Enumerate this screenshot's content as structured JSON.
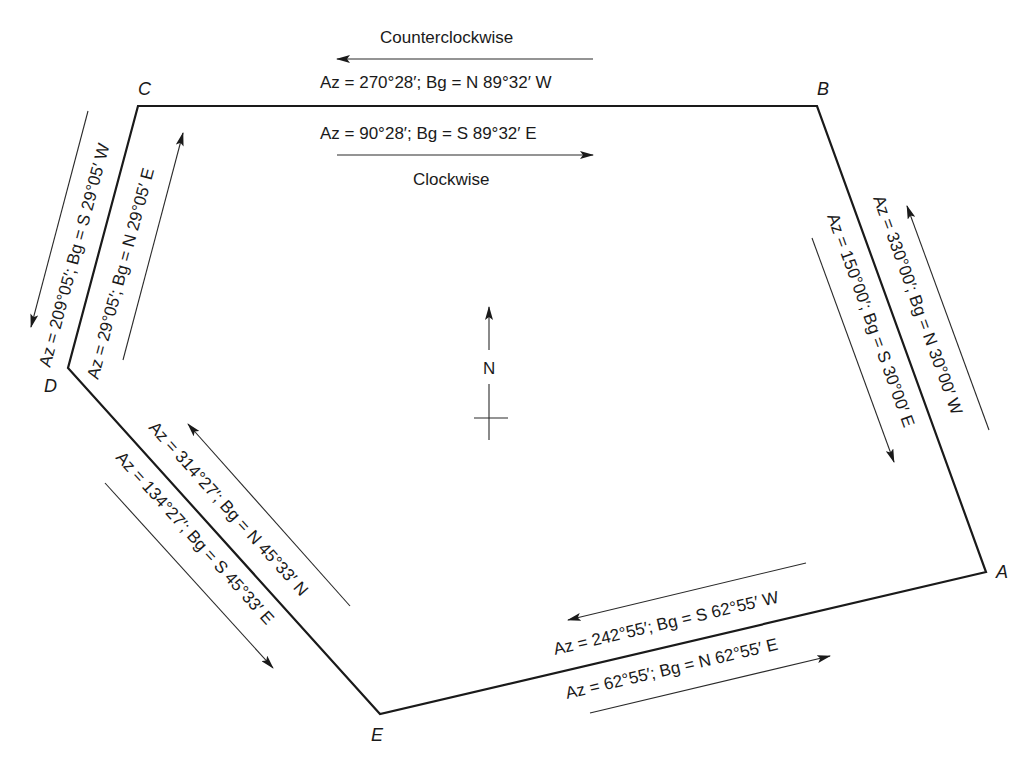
{
  "diagram": {
    "type": "closed traverse with azimuths and bearings",
    "vertices": [
      {
        "label": "A",
        "x": 986,
        "y": 572
      },
      {
        "label": "B",
        "x": 817,
        "y": 106
      },
      {
        "label": "C",
        "x": 138,
        "y": 106
      },
      {
        "label": "D",
        "x": 68,
        "y": 368
      },
      {
        "label": "E",
        "x": 380,
        "y": 714
      }
    ],
    "direction_labels": {
      "counterclockwise": "Counterclockwise",
      "clockwise": "Clockwise"
    },
    "north_arrow": {
      "label": "N"
    },
    "courses": {
      "CB": {
        "ccw": "Az = 270°28′; Bg = N 89°32′ W",
        "cw": "Az = 90°28′; Bg = S 89°32′ E"
      },
      "BA": {
        "ccw": "Az = 330°00′; Bg = N 30°00′ W",
        "cw": "Az = 150°00′; Bg = S 30°00′ E"
      },
      "AE": {
        "ccw": "Az = 242°55′; Bg = S 62°55′ W",
        "cw": "Az = 62°55′; Bg = N 62°55′ E"
      },
      "ED": {
        "ccw": "Az = 314°27′; Bg = N 45°33′ N",
        "cw": "Az = 134°27′; Bg = S 45°33′ E"
      },
      "DC": {
        "ccw": "Az = 209°05′; Bg = S 29°05′ W",
        "cw": "Az = 29°05′; Bg = N 29°05′ E"
      }
    }
  }
}
